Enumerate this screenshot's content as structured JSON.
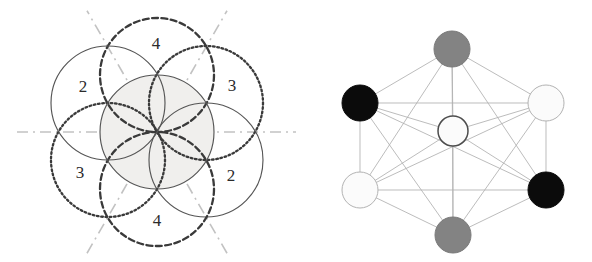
{
  "figure": {
    "background_color": "#ffffff",
    "width": 592,
    "height": 262
  },
  "panels": [
    {
      "id": "left",
      "name": "circle-rosette-panel",
      "description": "Seven overlapping circles forming a flower/rosette pattern with mirror axes and numbered regions"
    },
    {
      "id": "right",
      "name": "node-graph-panel",
      "description": "Six outer nodes arranged hexagonally around one central node, fully connected by thin edges"
    }
  ],
  "left_panel": {
    "center": {
      "x": 157,
      "y": 132
    },
    "circle_radius": 57,
    "center_circle": {
      "name": "central-circle",
      "cx": 157,
      "cy": 132,
      "r": 57,
      "stroke": "#555555",
      "fill": "#f0efed",
      "style": "solid"
    },
    "outer_circles": [
      {
        "name": "circle-top",
        "cx": 157,
        "cy": 75,
        "r": 57,
        "style": "dashed",
        "stroke": "#3a3a3a"
      },
      {
        "name": "circle-upper-right",
        "cx": 206,
        "cy": 103,
        "r": 57,
        "style": "dotted",
        "stroke": "#3a3a3a"
      },
      {
        "name": "circle-lower-right",
        "cx": 206,
        "cy": 160,
        "r": 57,
        "style": "solid",
        "stroke": "#555555"
      },
      {
        "name": "circle-bottom",
        "cx": 157,
        "cy": 189,
        "r": 57,
        "style": "dashed",
        "stroke": "#3a3a3a"
      },
      {
        "name": "circle-lower-left",
        "cx": 108,
        "cy": 160,
        "r": 57,
        "style": "dotted",
        "stroke": "#3a3a3a"
      },
      {
        "name": "circle-upper-left",
        "cx": 108,
        "cy": 103,
        "r": 57,
        "style": "solid",
        "stroke": "#555555"
      }
    ],
    "mirror_axes": [
      {
        "name": "axis-horizontal",
        "angle_deg": 0,
        "style": "dash-dot",
        "stroke": "#c2c2c2"
      },
      {
        "name": "axis-60",
        "angle_deg": 60,
        "style": "dash-dot",
        "stroke": "#c2c2c2"
      },
      {
        "name": "axis-120",
        "angle_deg": 120,
        "style": "dash-dot",
        "stroke": "#c2c2c2"
      }
    ],
    "axis_half_length": 140,
    "region_labels": [
      {
        "name": "region-label-top",
        "text": "4",
        "x": 156,
        "y": 45
      },
      {
        "name": "region-label-upper-left",
        "text": "2",
        "x": 83,
        "y": 88
      },
      {
        "name": "region-label-upper-right",
        "text": "3",
        "x": 232,
        "y": 87
      },
      {
        "name": "region-label-lower-left",
        "text": "3",
        "x": 80,
        "y": 174
      },
      {
        "name": "region-label-lower-right",
        "text": "2",
        "x": 231,
        "y": 177
      },
      {
        "name": "region-label-bottom",
        "text": "4",
        "x": 157,
        "y": 222
      }
    ]
  },
  "right_panel": {
    "center": {
      "x": 453,
      "y": 131
    },
    "node_radius": 18,
    "center_node_radius": 15,
    "edge_color": "#b0b0b0",
    "colors": {
      "black": "#0b0b0b",
      "gray": "#838383",
      "white": "#fbfbfb",
      "node_outline": "#9a9a9a",
      "center_outline": "#4d4d4d"
    },
    "nodes": [
      {
        "name": "node-top",
        "label": "top",
        "cx": 452,
        "cy": 49,
        "r": 18,
        "fill_key": "gray",
        "outline": "#7a7a7a"
      },
      {
        "name": "node-upper-left",
        "label": "upper-left",
        "cx": 360,
        "cy": 103,
        "r": 18,
        "fill_key": "black",
        "outline": "#0b0b0b"
      },
      {
        "name": "node-upper-right",
        "label": "upper-right",
        "cx": 546,
        "cy": 103,
        "r": 18,
        "fill_key": "white",
        "outline": "#b3b3b3"
      },
      {
        "name": "node-lower-left",
        "label": "lower-left",
        "cx": 360,
        "cy": 190,
        "r": 18,
        "fill_key": "white",
        "outline": "#b3b3b3"
      },
      {
        "name": "node-lower-right",
        "label": "lower-right",
        "cx": 546,
        "cy": 190,
        "r": 18,
        "fill_key": "black",
        "outline": "#0b0b0b"
      },
      {
        "name": "node-bottom",
        "label": "bottom",
        "cx": 453,
        "cy": 235,
        "r": 18,
        "fill_key": "gray",
        "outline": "#7a7a7a"
      },
      {
        "name": "node-center",
        "label": "center",
        "cx": 453,
        "cy": 131,
        "r": 15,
        "fill_key": "white",
        "outline": "#4d4d4d"
      }
    ],
    "edges": [
      {
        "from": "node-top",
        "to": "node-upper-left"
      },
      {
        "from": "node-top",
        "to": "node-upper-right"
      },
      {
        "from": "node-top",
        "to": "node-lower-left"
      },
      {
        "from": "node-top",
        "to": "node-lower-right"
      },
      {
        "from": "node-top",
        "to": "node-bottom"
      },
      {
        "from": "node-top",
        "to": "node-center"
      },
      {
        "from": "node-upper-left",
        "to": "node-upper-right"
      },
      {
        "from": "node-upper-left",
        "to": "node-lower-left"
      },
      {
        "from": "node-upper-left",
        "to": "node-lower-right"
      },
      {
        "from": "node-upper-left",
        "to": "node-bottom"
      },
      {
        "from": "node-upper-left",
        "to": "node-center"
      },
      {
        "from": "node-upper-right",
        "to": "node-lower-left"
      },
      {
        "from": "node-upper-right",
        "to": "node-lower-right"
      },
      {
        "from": "node-upper-right",
        "to": "node-bottom"
      },
      {
        "from": "node-upper-right",
        "to": "node-center"
      },
      {
        "from": "node-lower-left",
        "to": "node-lower-right"
      },
      {
        "from": "node-lower-left",
        "to": "node-bottom"
      },
      {
        "from": "node-lower-left",
        "to": "node-center"
      },
      {
        "from": "node-lower-right",
        "to": "node-bottom"
      },
      {
        "from": "node-lower-right",
        "to": "node-center"
      },
      {
        "from": "node-bottom",
        "to": "node-center"
      }
    ]
  }
}
